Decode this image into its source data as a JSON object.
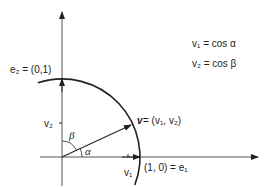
{
  "diagram": {
    "type": "unit-circle-vector",
    "origin": [
      62,
      157
    ],
    "radius": 78,
    "labels": {
      "e2": "e₂ = (0,1)",
      "e1": "(1, 0) = e₁",
      "v": "v",
      "v_eq": " = (v₁, v₂)",
      "v1_tick": "v₁",
      "v2_tick": "v₂",
      "alpha": "α",
      "beta": "β",
      "eq1": "v₁ = cos α",
      "eq2": "v₂ = cos β"
    },
    "colors": {
      "ink": "#222222",
      "axis": "#555555",
      "background": "#ffffff"
    }
  }
}
